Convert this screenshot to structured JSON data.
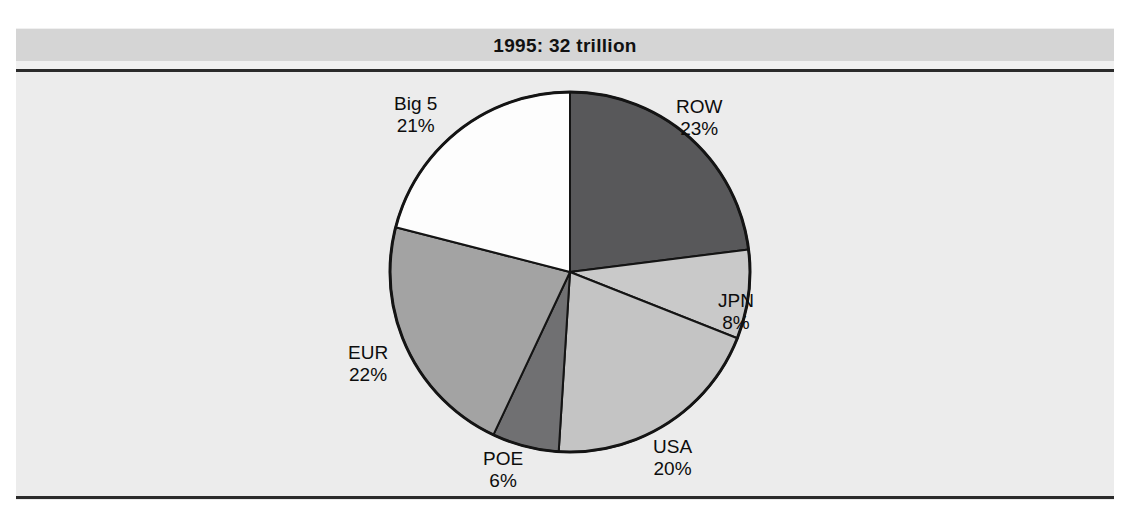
{
  "figure": {
    "title": "1995: 32 trillion"
  },
  "chart_data": {
    "type": "pie",
    "title": "1995: 32 trillion",
    "total_label": "32 trillion",
    "year": "1995",
    "units": "trillion",
    "total_value": 32,
    "start_angle_deg": 0,
    "direction": "clockwise",
    "legend": "none (labels placed outside slices)",
    "categories": [
      "ROW",
      "JPN",
      "USA",
      "POE",
      "EUR",
      "Big 5"
    ],
    "values": [
      23,
      8,
      20,
      6,
      22,
      21
    ],
    "value_labels": [
      "23%",
      "8%",
      "20%",
      "6%",
      "22%",
      "21%"
    ],
    "colors": [
      "#58585a",
      "#c9c9c9",
      "#c4c4c4",
      "#707072",
      "#a3a3a3",
      "#fdfdfd"
    ],
    "slices": [
      {
        "label": "ROW",
        "percent": 23,
        "percent_label": "23%",
        "color": "#58585a"
      },
      {
        "label": "JPN",
        "percent": 8,
        "percent_label": "8%",
        "color": "#c9c9c9"
      },
      {
        "label": "USA",
        "percent": 20,
        "percent_label": "20%",
        "color": "#c4c4c4"
      },
      {
        "label": "POE",
        "percent": 6,
        "percent_label": "6%",
        "color": "#707072"
      },
      {
        "label": "EUR",
        "percent": 22,
        "percent_label": "22%",
        "color": "#a3a3a3"
      },
      {
        "label": "Big 5",
        "percent": 21,
        "percent_label": "21%",
        "color": "#fdfdfd"
      }
    ]
  },
  "colors": {
    "stroke": "#141414",
    "rule": "#2b2b2b",
    "title_band": "#d5d5d5",
    "paper": "#ececec"
  }
}
